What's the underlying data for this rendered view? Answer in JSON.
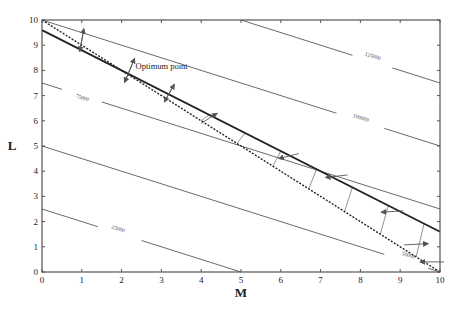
{
  "chart_data": {
    "type": "line",
    "title": "",
    "xlabel": "M",
    "ylabel": "L",
    "xlim": [
      0,
      10
    ],
    "ylim": [
      0,
      10
    ],
    "xticks": [
      0,
      1,
      2,
      3,
      4,
      5,
      6,
      7,
      8,
      9,
      10
    ],
    "yticks": [
      0,
      1,
      2,
      3,
      4,
      5,
      6,
      7,
      8,
      9,
      10
    ],
    "grid": false,
    "legend": null,
    "series": [
      {
        "name": "isocost 25000",
        "label": "25000",
        "style": "thin-gray",
        "points": [
          [
            0,
            2.5
          ],
          [
            5,
            0
          ]
        ],
        "label_at": [
          1.9,
          1.65
        ],
        "gap": [
          1.4,
          2.5
        ]
      },
      {
        "name": "isocost 50000",
        "label": "50000",
        "style": "thin-gray",
        "points": [
          [
            0,
            5
          ],
          [
            10,
            0
          ]
        ],
        "label_at": [
          9.2,
          0.6
        ],
        "gap": [
          8.6,
          9.7
        ]
      },
      {
        "name": "isocost 75000",
        "label": "75000",
        "style": "thin-gray",
        "points": [
          [
            0,
            7.5
          ],
          [
            10,
            2.5
          ]
        ],
        "label_at": [
          1.0,
          6.85
        ],
        "gap": [
          0.5,
          1.5
        ]
      },
      {
        "name": "isocost 100000",
        "label": "100000",
        "style": "thin-gray",
        "points": [
          [
            0,
            10
          ],
          [
            10,
            5
          ]
        ],
        "label_at": [
          8.0,
          6.05
        ],
        "gap": [
          7.4,
          8.6
        ]
      },
      {
        "name": "isocost 125000",
        "label": "125000",
        "style": "thin-gray",
        "points": [
          [
            5,
            10
          ],
          [
            10,
            7.5
          ]
        ],
        "label_at": [
          8.3,
          8.5
        ],
        "gap": [
          7.8,
          8.8
        ]
      },
      {
        "name": "constraint (dashed)",
        "label": "",
        "style": "dashed-dark",
        "points": [
          [
            0,
            10
          ],
          [
            10,
            0
          ]
        ]
      },
      {
        "name": "constraint (solid)",
        "label": "",
        "style": "thick-dark",
        "points": [
          [
            0,
            9.6
          ],
          [
            10,
            1.6
          ]
        ]
      }
    ],
    "hatch_region": {
      "between": [
        "constraint (solid)",
        "constraint (dashed)"
      ],
      "m_range": [
        4.0,
        10.0
      ]
    },
    "arrows": [
      {
        "at": [
          1.0,
          9.2
        ],
        "dir": "both",
        "dx": 0.1,
        "dy": 0.9
      },
      {
        "at": [
          2.2,
          8.0
        ],
        "dir": "both",
        "dx": 0.25,
        "dy": 0.95
      },
      {
        "at": [
          3.2,
          7.1
        ],
        "dir": "both",
        "dx": 0.25,
        "dy": 0.7
      },
      {
        "at": [
          4.2,
          6.1
        ],
        "dir": "from",
        "dx": -0.4,
        "dy": -0.4
      },
      {
        "at": [
          6.2,
          4.6
        ],
        "dir": "to",
        "dx": -0.5,
        "dy": -0.2
      },
      {
        "at": [
          7.4,
          3.8
        ],
        "dir": "to",
        "dx": -0.55,
        "dy": -0.1
      },
      {
        "at": [
          8.8,
          2.4
        ],
        "dir": "to",
        "dx": -0.55,
        "dy": -0.05
      },
      {
        "at": [
          9.4,
          1.1
        ],
        "dir": "to",
        "dx": 0.6,
        "dy": 0.05
      },
      {
        "at": [
          9.8,
          0.4
        ],
        "dir": "to",
        "dx": -0.6,
        "dy": 0.0
      }
    ],
    "annotations": [
      {
        "text": "Optimum point",
        "at": [
          2.35,
          8.05
        ]
      }
    ],
    "optimum_point": [
      2.0,
      8.0
    ]
  }
}
